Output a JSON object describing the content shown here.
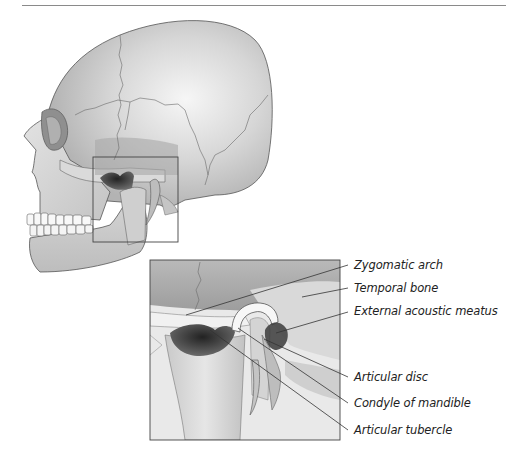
{
  "figure": {
    "kind": "anatomical-illustration",
    "labels": [
      {
        "id": "zygomatic-arch",
        "text": "Zygomatic arch"
      },
      {
        "id": "temporal-bone",
        "text": "Temporal bone"
      },
      {
        "id": "external-acoustic-meatus",
        "text": "External acoustic meatus"
      },
      {
        "id": "articular-disc",
        "text": "Articular disc"
      },
      {
        "id": "condyle-of-mandible",
        "text": "Condyle of mandible"
      },
      {
        "id": "articular-tubercle",
        "text": "Articular tubercle"
      }
    ]
  },
  "colors": {
    "bone_light": "#e4e4e4",
    "bone_mid": "#c9c9c9",
    "bone_dark": "#8f8f8f",
    "cavity": "#3a3a3a",
    "outline": "#555555",
    "leader": "#333333"
  }
}
